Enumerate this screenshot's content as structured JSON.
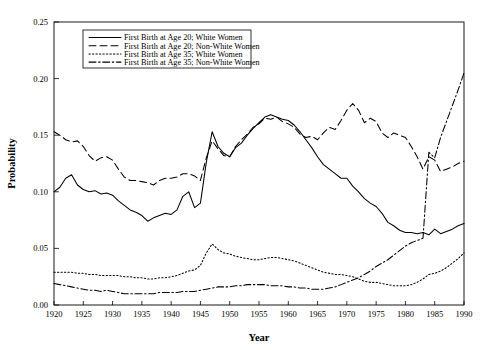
{
  "chart_data": {
    "type": "line",
    "title": "",
    "xlabel": "Year",
    "ylabel": "Probability",
    "xlim": [
      1920,
      1990
    ],
    "ylim": [
      0.0,
      0.25
    ],
    "xticks": [
      1920,
      1925,
      1930,
      1935,
      1940,
      1945,
      1950,
      1955,
      1960,
      1965,
      1970,
      1975,
      1980,
      1985,
      1990
    ],
    "yticks": [
      "0.00",
      "0.05",
      "0.10",
      "0.15",
      "0.20",
      "0.25"
    ],
    "ytick_values": [
      0.0,
      0.05,
      0.1,
      0.15,
      0.2,
      0.25
    ],
    "grid": false,
    "legend_position": "upper-left-inside",
    "x": [
      1920,
      1921,
      1922,
      1923,
      1924,
      1925,
      1926,
      1927,
      1928,
      1929,
      1930,
      1931,
      1932,
      1933,
      1934,
      1935,
      1936,
      1937,
      1938,
      1939,
      1940,
      1941,
      1942,
      1943,
      1944,
      1945,
      1946,
      1947,
      1948,
      1949,
      1950,
      1951,
      1952,
      1953,
      1954,
      1955,
      1956,
      1957,
      1958,
      1959,
      1960,
      1961,
      1962,
      1963,
      1964,
      1965,
      1966,
      1967,
      1968,
      1969,
      1970,
      1971,
      1972,
      1973,
      1974,
      1975,
      1976,
      1977,
      1978,
      1979,
      1980,
      1981,
      1982,
      1983,
      1984,
      1985,
      1986,
      1987,
      1988,
      1989,
      1990
    ],
    "series": [
      {
        "name": "First Birth at Age 20; White Women",
        "style": "solid",
        "color": "#000000",
        "values": [
          0.1,
          0.104,
          0.112,
          0.115,
          0.106,
          0.102,
          0.1,
          0.101,
          0.098,
          0.099,
          0.097,
          0.092,
          0.088,
          0.084,
          0.082,
          0.079,
          0.074,
          0.077,
          0.079,
          0.081,
          0.08,
          0.084,
          0.096,
          0.1,
          0.086,
          0.09,
          0.126,
          0.153,
          0.14,
          0.134,
          0.131,
          0.139,
          0.143,
          0.15,
          0.156,
          0.161,
          0.166,
          0.168,
          0.166,
          0.164,
          0.163,
          0.159,
          0.153,
          0.146,
          0.139,
          0.131,
          0.124,
          0.12,
          0.116,
          0.112,
          0.112,
          0.105,
          0.1,
          0.094,
          0.09,
          0.087,
          0.081,
          0.073,
          0.07,
          0.066,
          0.064,
          0.064,
          0.063,
          0.064,
          0.062,
          0.067,
          0.063,
          0.065,
          0.067,
          0.07,
          0.072
        ]
      },
      {
        "name": "First Birth at Age 20; Non-White Women",
        "style": "dashed",
        "color": "#000000",
        "values": [
          0.153,
          0.15,
          0.146,
          0.144,
          0.145,
          0.14,
          0.132,
          0.127,
          0.13,
          0.131,
          0.128,
          0.12,
          0.113,
          0.11,
          0.11,
          0.109,
          0.108,
          0.106,
          0.11,
          0.112,
          0.112,
          0.113,
          0.116,
          0.116,
          0.114,
          0.11,
          0.13,
          0.145,
          0.138,
          0.132,
          0.131,
          0.14,
          0.146,
          0.151,
          0.157,
          0.16,
          0.165,
          0.164,
          0.166,
          0.162,
          0.16,
          0.157,
          0.151,
          0.148,
          0.149,
          0.146,
          0.152,
          0.157,
          0.155,
          0.163,
          0.172,
          0.178,
          0.172,
          0.161,
          0.165,
          0.162,
          0.152,
          0.148,
          0.152,
          0.15,
          0.148,
          0.14,
          0.131,
          0.12,
          0.131,
          0.128,
          0.118,
          0.12,
          0.122,
          0.125,
          0.127
        ]
      },
      {
        "name": "First Birth at Age 35; White Women",
        "style": "dotted",
        "color": "#000000",
        "values": [
          0.029,
          0.029,
          0.029,
          0.029,
          0.028,
          0.028,
          0.027,
          0.027,
          0.026,
          0.026,
          0.026,
          0.026,
          0.025,
          0.025,
          0.024,
          0.024,
          0.023,
          0.023,
          0.024,
          0.024,
          0.025,
          0.026,
          0.028,
          0.03,
          0.031,
          0.035,
          0.046,
          0.054,
          0.049,
          0.046,
          0.045,
          0.043,
          0.042,
          0.041,
          0.04,
          0.04,
          0.041,
          0.042,
          0.042,
          0.041,
          0.04,
          0.039,
          0.037,
          0.035,
          0.033,
          0.031,
          0.029,
          0.028,
          0.027,
          0.027,
          0.026,
          0.025,
          0.023,
          0.021,
          0.02,
          0.02,
          0.019,
          0.018,
          0.017,
          0.017,
          0.017,
          0.018,
          0.02,
          0.023,
          0.027,
          0.028,
          0.03,
          0.033,
          0.037,
          0.041,
          0.046
        ]
      },
      {
        "name": "First Birth at Age 35; Non-White Women",
        "style": "dashdot",
        "color": "#000000",
        "values": [
          0.019,
          0.018,
          0.017,
          0.016,
          0.015,
          0.014,
          0.013,
          0.013,
          0.012,
          0.013,
          0.012,
          0.011,
          0.01,
          0.01,
          0.01,
          0.01,
          0.01,
          0.01,
          0.011,
          0.011,
          0.011,
          0.011,
          0.012,
          0.012,
          0.012,
          0.013,
          0.014,
          0.015,
          0.016,
          0.016,
          0.016,
          0.017,
          0.017,
          0.018,
          0.018,
          0.018,
          0.018,
          0.017,
          0.017,
          0.017,
          0.016,
          0.016,
          0.015,
          0.015,
          0.014,
          0.014,
          0.014,
          0.015,
          0.016,
          0.018,
          0.02,
          0.022,
          0.024,
          0.027,
          0.03,
          0.034,
          0.037,
          0.04,
          0.044,
          0.048,
          0.052,
          0.055,
          0.057,
          0.059,
          0.135,
          0.13,
          0.148,
          0.162,
          0.176,
          0.19,
          0.205
        ]
      }
    ]
  }
}
